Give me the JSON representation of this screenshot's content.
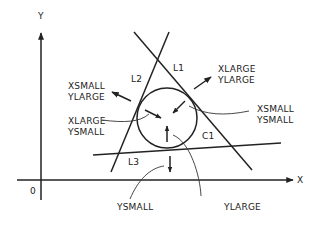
{
  "diagram": {
    "axes": {
      "x_label": "X",
      "y_label": "Y",
      "origin_label": "0"
    },
    "lines": [
      {
        "id": "L1",
        "label": "L1"
      },
      {
        "id": "L2",
        "label": "L2"
      },
      {
        "id": "L3",
        "label": "L3"
      }
    ],
    "circle": {
      "id": "C1",
      "label": "C1"
    },
    "region_labels": {
      "xsmall_ylarge": {
        "line1": "XSMALL",
        "line2": "YLARGE"
      },
      "xlarge_ylarge": {
        "line1": "XLARGE",
        "line2": "YLARGE"
      },
      "xlarge_ysmall": {
        "line1": "XLARGE",
        "line2": "YSMALL"
      },
      "xsmall_ysmall": {
        "line1": "XSMALL",
        "line2": "YSMALL"
      },
      "ysmall": "YSMALL",
      "ylarge": "YLARGE"
    },
    "colors": {
      "stroke": "#222222",
      "background": "#ffffff"
    }
  }
}
